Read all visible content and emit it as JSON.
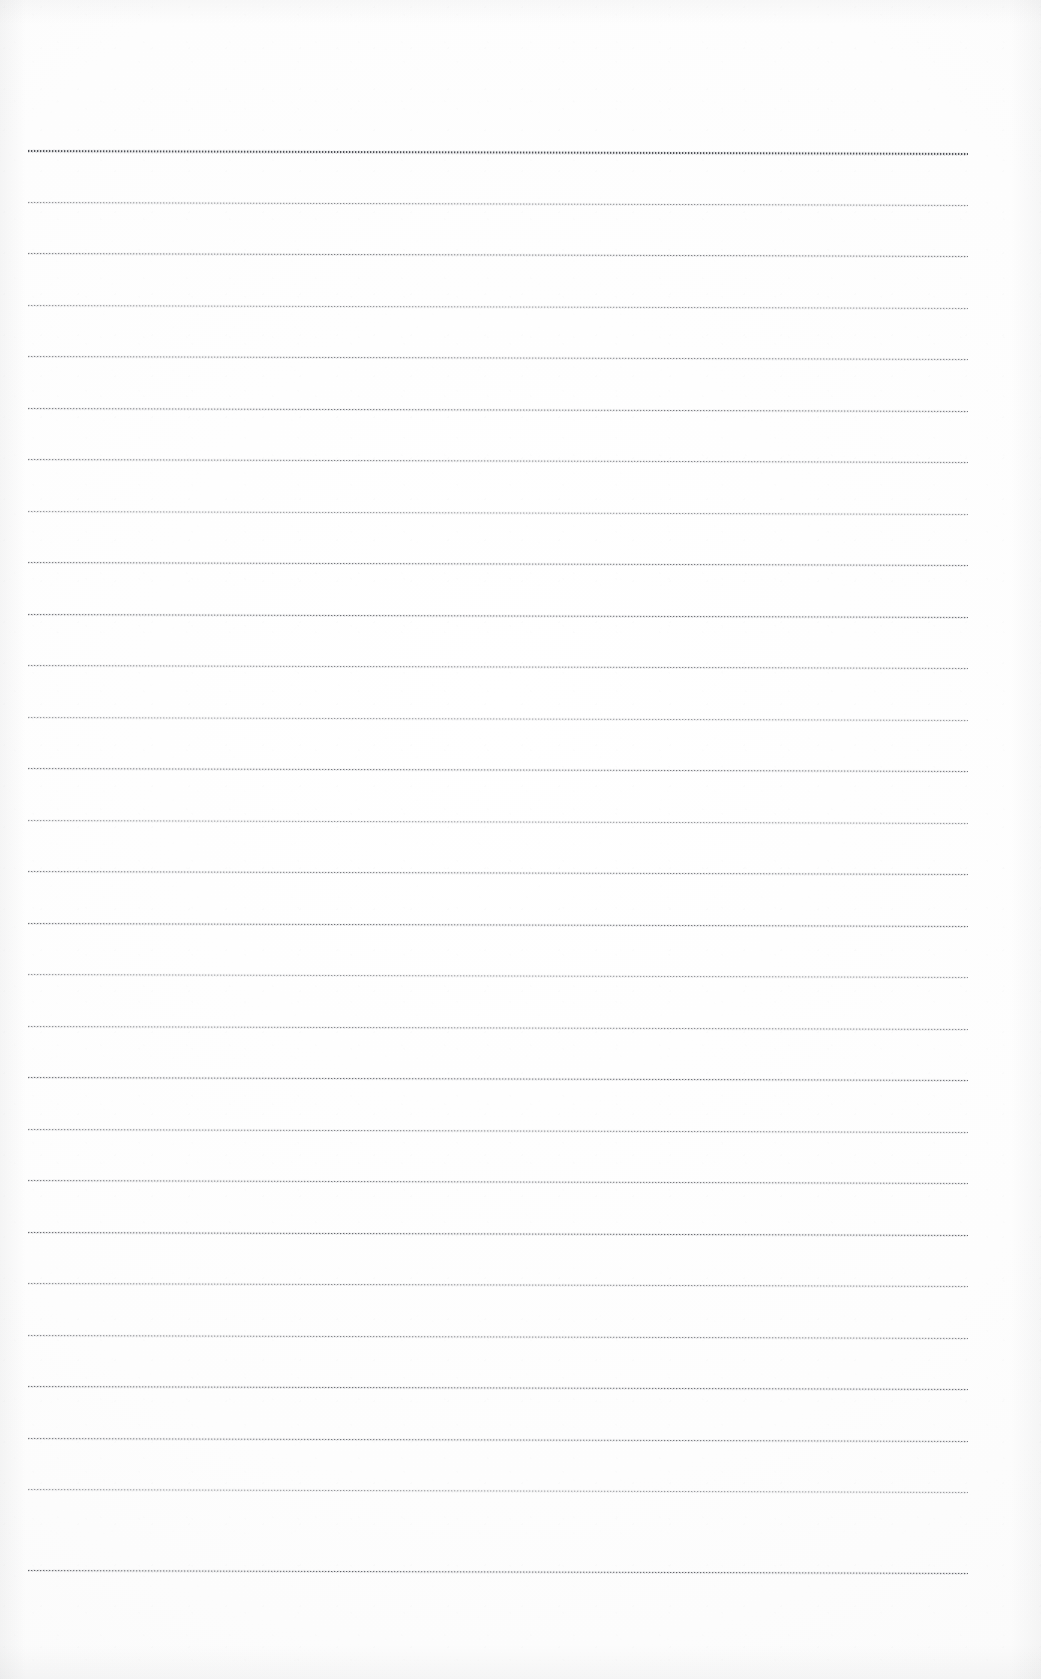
{
  "document": {
    "kind": "scanned-ruled-paper",
    "title": "Blank Ruled Notebook Page (Scan)",
    "page_width": 1041,
    "page_height": 1679,
    "paper_color": "#fdfdfd",
    "ink_color": "#46484e",
    "text_content": "",
    "writing_present": "none",
    "orientation": "portrait"
  },
  "ruling": {
    "line_count": 28,
    "first_line_y": 150,
    "line_spacing": 51.5,
    "left_margin_x": 28,
    "right_margin_x": 968,
    "line_length": 940,
    "skew_degrees": 0.18,
    "style": "horizontal-ruled",
    "vertical_margin_rule": "none",
    "lines": [
      {
        "index": 1,
        "y": 150,
        "weight": 2.0,
        "opacity": 0.95
      },
      {
        "index": 2,
        "y": 202,
        "weight": 1.0,
        "opacity": 0.62
      },
      {
        "index": 3,
        "y": 253,
        "weight": 1.2,
        "opacity": 0.7
      },
      {
        "index": 4,
        "y": 305,
        "weight": 1.0,
        "opacity": 0.6
      },
      {
        "index": 5,
        "y": 356,
        "weight": 1.1,
        "opacity": 0.66
      },
      {
        "index": 6,
        "y": 408,
        "weight": 1.2,
        "opacity": 0.72
      },
      {
        "index": 7,
        "y": 459,
        "weight": 1.1,
        "opacity": 0.68
      },
      {
        "index": 8,
        "y": 511,
        "weight": 1.0,
        "opacity": 0.58
      },
      {
        "index": 9,
        "y": 562,
        "weight": 1.2,
        "opacity": 0.74
      },
      {
        "index": 10,
        "y": 614,
        "weight": 1.3,
        "opacity": 0.78
      },
      {
        "index": 11,
        "y": 665,
        "weight": 1.1,
        "opacity": 0.66
      },
      {
        "index": 12,
        "y": 717,
        "weight": 1.0,
        "opacity": 0.56
      },
      {
        "index": 13,
        "y": 768,
        "weight": 1.2,
        "opacity": 0.72
      },
      {
        "index": 14,
        "y": 820,
        "weight": 1.0,
        "opacity": 0.58
      },
      {
        "index": 15,
        "y": 871,
        "weight": 1.2,
        "opacity": 0.7
      },
      {
        "index": 16,
        "y": 923,
        "weight": 1.3,
        "opacity": 0.76
      },
      {
        "index": 17,
        "y": 974,
        "weight": 1.0,
        "opacity": 0.58
      },
      {
        "index": 18,
        "y": 1026,
        "weight": 1.1,
        "opacity": 0.64
      },
      {
        "index": 19,
        "y": 1077,
        "weight": 1.3,
        "opacity": 0.78
      },
      {
        "index": 20,
        "y": 1129,
        "weight": 1.1,
        "opacity": 0.66
      },
      {
        "index": 21,
        "y": 1180,
        "weight": 1.2,
        "opacity": 0.72
      },
      {
        "index": 22,
        "y": 1232,
        "weight": 1.4,
        "opacity": 0.82
      },
      {
        "index": 23,
        "y": 1283,
        "weight": 1.1,
        "opacity": 0.64
      },
      {
        "index": 24,
        "y": 1335,
        "weight": 1.1,
        "opacity": 0.66
      },
      {
        "index": 25,
        "y": 1386,
        "weight": 1.3,
        "opacity": 0.78
      },
      {
        "index": 26,
        "y": 1438,
        "weight": 1.2,
        "opacity": 0.72
      },
      {
        "index": 27,
        "y": 1489,
        "weight": 1.0,
        "opacity": 0.56
      },
      {
        "index": 28,
        "y": 1570,
        "weight": 1.4,
        "opacity": 0.84
      }
    ]
  }
}
